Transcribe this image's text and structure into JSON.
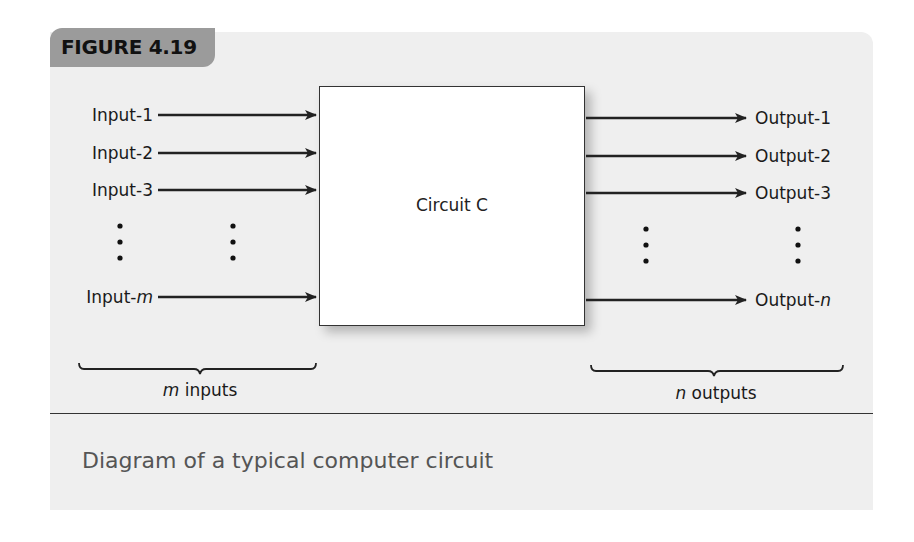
{
  "figure": {
    "label": "FIGURE 4.19",
    "caption": "Diagram of a typical computer circuit"
  },
  "circuit": {
    "label": "Circuit C"
  },
  "inputs": [
    {
      "prefix": "Input-",
      "index": "1",
      "italic": false
    },
    {
      "prefix": "Input-",
      "index": "2",
      "italic": false
    },
    {
      "prefix": "Input-",
      "index": "3",
      "italic": false
    },
    {
      "prefix": "Input-",
      "index": "m",
      "italic": true
    }
  ],
  "outputs": [
    {
      "prefix": "Output-",
      "index": "1",
      "italic": false
    },
    {
      "prefix": "Output-",
      "index": "2",
      "italic": false
    },
    {
      "prefix": "Output-",
      "index": "3",
      "italic": false
    },
    {
      "prefix": "Output-",
      "index": "n",
      "italic": true
    }
  ],
  "braces": {
    "inputs": {
      "var": "m",
      "text": " inputs"
    },
    "outputs": {
      "var": "n",
      "text": " outputs"
    }
  },
  "colors": {
    "panel_bg": "#efefef",
    "tab_bg": "#9b9b9b",
    "line": "#333333",
    "caption_text": "#555555"
  }
}
